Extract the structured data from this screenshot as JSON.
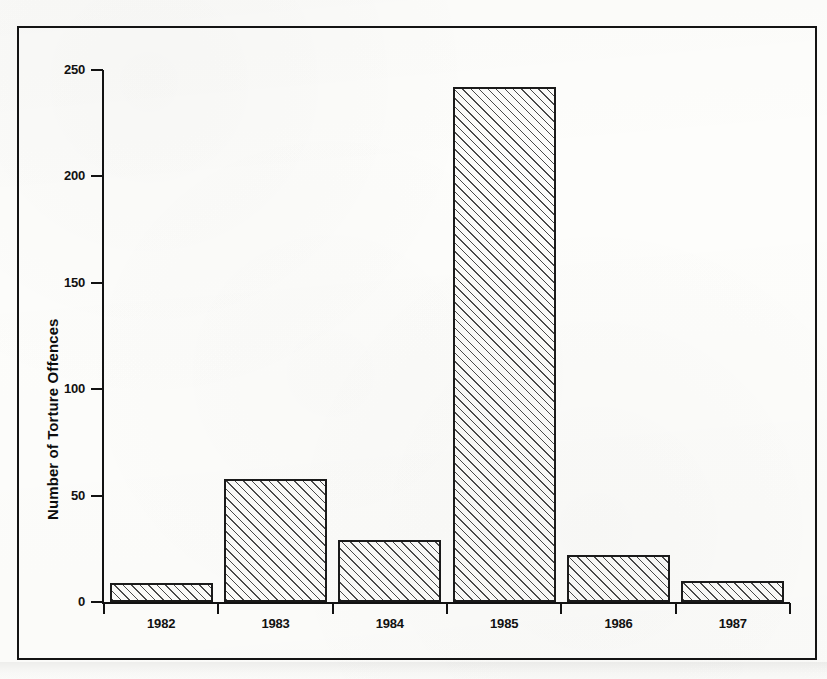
{
  "chart_data": {
    "type": "bar",
    "title": "",
    "subtitle": "",
    "xlabel": "",
    "ylabel": "Number of Torture Offences",
    "categories": [
      "1982",
      "1983",
      "1984",
      "1985",
      "1986",
      "1987"
    ],
    "values": [
      9,
      58,
      29,
      242,
      22,
      10
    ],
    "series": [
      {
        "name": "Number of Torture Offences",
        "values": [
          9,
          58,
          29,
          242,
          22,
          10
        ]
      }
    ],
    "ylim": [
      0,
      250
    ],
    "y_ticks": [
      0,
      50,
      100,
      150,
      200,
      250
    ],
    "y_tick_labels": [
      "0",
      "50",
      "100",
      "150",
      "200",
      "250"
    ],
    "grid": false,
    "legend": false,
    "legend_position": "none",
    "bar_fill": "diagonal-hatch",
    "bar_outline_color": "#1a1a1a",
    "background_color": "#fdfdfb",
    "frame": true,
    "annotations": []
  },
  "axes": {
    "y_title": "Number of Torture Offences",
    "ticks": [
      {
        "label": "250",
        "value": 250
      },
      {
        "label": "200",
        "value": 200
      },
      {
        "label": "150",
        "value": 150
      },
      {
        "label": "100",
        "value": 100
      },
      {
        "label": "50",
        "value": 50
      },
      {
        "label": "0",
        "value": 0
      }
    ]
  },
  "bars": [
    {
      "label": "1982",
      "value": 9
    },
    {
      "label": "1983",
      "value": 58
    },
    {
      "label": "1984",
      "value": 29
    },
    {
      "label": "1985",
      "value": 242
    },
    {
      "label": "1986",
      "value": 22
    },
    {
      "label": "1987",
      "value": 10
    }
  ]
}
